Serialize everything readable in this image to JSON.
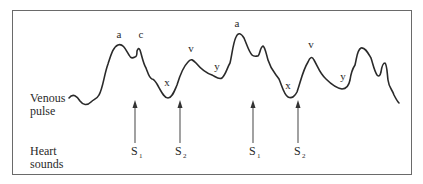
{
  "labels": {
    "venous_pulse_line1": "Venous",
    "venous_pulse_line2": "pulse",
    "heart_sounds_line1": "Heart",
    "heart_sounds_line2": "sounds"
  },
  "waves": {
    "a1": "a",
    "c1": "c",
    "x1": "x",
    "v1": "v",
    "y1": "y",
    "a2": "a",
    "x2": "x",
    "v2": "v",
    "y2": "y"
  },
  "sounds": [
    {
      "base": "S",
      "sub": "1"
    },
    {
      "base": "S",
      "sub": "2"
    },
    {
      "base": "S",
      "sub": "1"
    },
    {
      "base": "S",
      "sub": "2"
    }
  ],
  "colors": {
    "stroke": "#2a2a2a",
    "arrow": "#555555",
    "frame": "#6a6a6a"
  }
}
